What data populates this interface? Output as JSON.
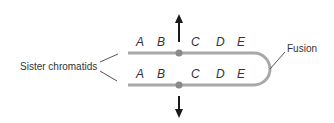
{
  "labels": {
    "sister_chromatids": "Sister chromatids",
    "fusion": "Fusion"
  },
  "top_chromatid": {
    "genes": [
      "A",
      "B",
      "C",
      "D",
      "E"
    ]
  },
  "bottom_chromatid": {
    "genes": [
      "A",
      "B",
      "C",
      "D",
      "E"
    ]
  },
  "colors": {
    "chromatid": "#a8a8a8",
    "centromere": "#8a8a8a",
    "arrow": "#1a1a1a",
    "text": "#333333"
  }
}
